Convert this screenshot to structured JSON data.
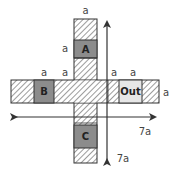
{
  "diagram": {
    "cells": {
      "A": {
        "label": "A",
        "color": "#8c8c8c"
      },
      "B": {
        "label": "B",
        "color": "#8c8c8c"
      },
      "C": {
        "label": "C",
        "color": "#8c8c8c"
      },
      "Out": {
        "label": "Out",
        "color": "#e6e6e6"
      }
    },
    "dimension_labels": {
      "top_width": "a",
      "a_cell_height": "a",
      "left_arm_1": "a",
      "left_arm_2": "a",
      "right_arm_1": "a",
      "right_arm_2": "a",
      "right_arm_height": "a",
      "horizontal_span": "7a",
      "vertical_span": "7a"
    },
    "colors": {
      "outline": "#333333",
      "hatch": "#555555",
      "arrow": "#333333"
    }
  }
}
